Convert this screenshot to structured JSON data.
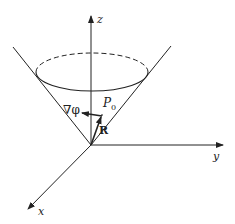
{
  "diagram": {
    "type": "3d-axes-cone",
    "axes": {
      "x": {
        "label": "x"
      },
      "y": {
        "label": "y"
      },
      "z": {
        "label": "z"
      }
    },
    "vectors": {
      "gradient": {
        "label": "∇φ"
      },
      "position": {
        "label": "R"
      }
    },
    "point": {
      "label": "P",
      "subscript": "0"
    },
    "colors": {
      "stroke": "#222222",
      "background": "#ffffff"
    }
  }
}
